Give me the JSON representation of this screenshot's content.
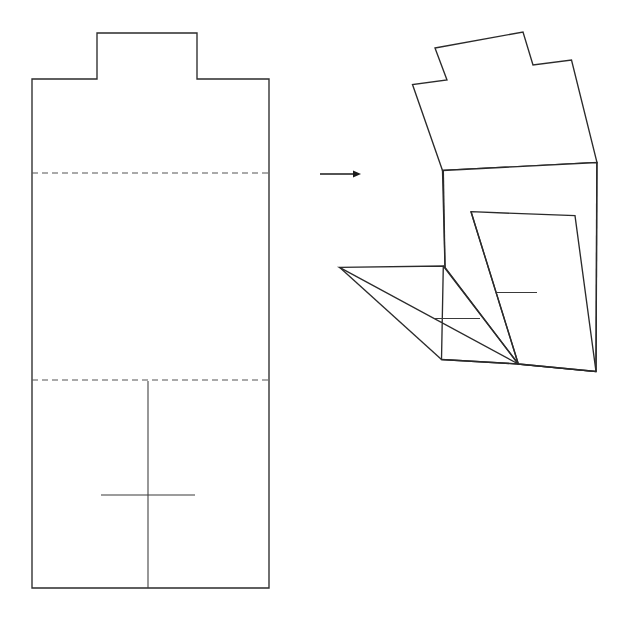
{
  "figure": {
    "background_color": "#ffffff",
    "line_color": "#2b2b2b",
    "fold_line_color": "#555555",
    "arrow_color": "#1a1a1a",
    "canvas": {
      "width": 629,
      "height": 618
    },
    "flat_net": {
      "label": "flat net",
      "outline_points": "97,33 197,33 197,79 269,79 269,588 32,588 32,79 97,79",
      "fold_lines": [
        {
          "name": "upper-fold",
          "points": "32,173 269,173"
        },
        {
          "name": "lower-fold",
          "points": "32,380 269,380"
        }
      ],
      "center_line": {
        "name": "vertical-center-line",
        "points": "148,381 148,588"
      },
      "cross_line": {
        "name": "horizontal-cross-line",
        "points": "101,495 195,495"
      }
    },
    "arrow": {
      "label": "transformation arrow",
      "shaft": "320,174 355,174",
      "head": "361,174 353,170.5 353,177.5"
    },
    "folded_form": {
      "label": "folded form",
      "top_panel": "435,48 523,32 533,65 571.5,60 597,162.5 442.5,170.5 412.5,84.5 447,80",
      "front_right_panel": "442.5,170.5 597,162.5 596,371.5 518.3,364 445,267.5",
      "left_flap": "339.5,267.3 443.3,266 441.5,359.5 518.3,364",
      "inner_panel": "471,211.7 575,215.7 596,371.5 518.3,364",
      "inner_panel_left_edge": "471,211.7 518.3,364",
      "left_vertical_edge": "443.3,170.5 445,267.5",
      "right_vertical_edge": "596.8,162.5 596,371.5",
      "flap_diagonal": "339.5,267.3 441.5,359.5",
      "flap_inner_diagonal": "443.3,266 518.3,364",
      "bottom_edge": "441.5,359.5 518.3,364 596,371.5",
      "tick_marks": [
        {
          "name": "upper-tick",
          "points": "497,292.5 537,292.5"
        },
        {
          "name": "lower-tick",
          "points": "435,318.5 480,318.5"
        }
      ]
    }
  }
}
